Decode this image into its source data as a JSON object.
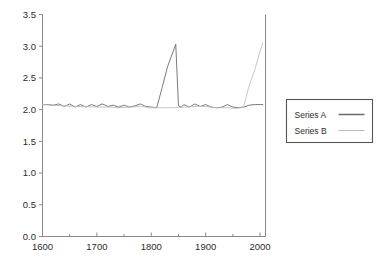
{
  "chart_data": {
    "type": "line",
    "title": "",
    "xlabel": "",
    "ylabel": "",
    "xlim": [
      1600,
      2010
    ],
    "ylim": [
      0.0,
      3.5
    ],
    "grid": false,
    "legend_position": "right-outside",
    "x_ticks": [
      1600,
      1700,
      1800,
      1900,
      2000
    ],
    "x_tick_labels": [
      "1600",
      "1700",
      "1800",
      "1900",
      "2000"
    ],
    "x_minor_ticks": [
      1650,
      1750,
      1850,
      1950
    ],
    "y_ticks": [
      0.0,
      0.5,
      1.0,
      1.5,
      2.0,
      2.5,
      3.0,
      3.5
    ],
    "y_tick_labels": [
      "0.0",
      "0.5",
      "1.0",
      "1.5",
      "2.0",
      "2.5",
      "3.0",
      "3.5"
    ],
    "series": [
      {
        "name": "Series A",
        "color": "#6b6b6b",
        "x": [
          1600,
          1610,
          1620,
          1630,
          1640,
          1650,
          1660,
          1670,
          1680,
          1690,
          1700,
          1710,
          1720,
          1730,
          1740,
          1750,
          1760,
          1770,
          1780,
          1790,
          1800,
          1810,
          1820,
          1830,
          1845,
          1850,
          1855,
          1860,
          1870,
          1880,
          1890,
          1900,
          1910,
          1920,
          1930,
          1940,
          1950,
          1960,
          1970,
          1980,
          1990,
          2000,
          2005
        ],
        "y": [
          2.08,
          2.08,
          2.07,
          2.09,
          2.05,
          2.09,
          2.04,
          2.08,
          2.04,
          2.08,
          2.05,
          2.09,
          2.05,
          2.07,
          2.04,
          2.07,
          2.04,
          2.06,
          2.09,
          2.05,
          2.04,
          2.03,
          2.35,
          2.68,
          3.03,
          2.06,
          2.04,
          2.08,
          2.04,
          2.09,
          2.05,
          2.08,
          2.04,
          2.03,
          2.04,
          2.08,
          2.04,
          2.03,
          2.04,
          2.07,
          2.08,
          2.08,
          2.08
        ]
      },
      {
        "name": "Series B",
        "color": "#bdbdbd",
        "x": [
          1600,
          1620,
          1640,
          1660,
          1680,
          1700,
          1720,
          1740,
          1760,
          1780,
          1800,
          1820,
          1840,
          1860,
          1880,
          1900,
          1920,
          1940,
          1955,
          1965,
          1970,
          1980,
          1990,
          2000,
          2005
        ],
        "y": [
          2.08,
          2.07,
          2.06,
          2.05,
          2.05,
          2.04,
          2.04,
          2.03,
          2.04,
          2.05,
          2.03,
          2.03,
          2.03,
          2.04,
          2.05,
          2.05,
          2.03,
          2.03,
          2.02,
          2.03,
          2.05,
          2.38,
          2.62,
          2.92,
          3.05
        ]
      }
    ],
    "annotations": []
  },
  "legend": {
    "entries": [
      {
        "label": "Series A"
      },
      {
        "label": "Series B"
      }
    ]
  }
}
